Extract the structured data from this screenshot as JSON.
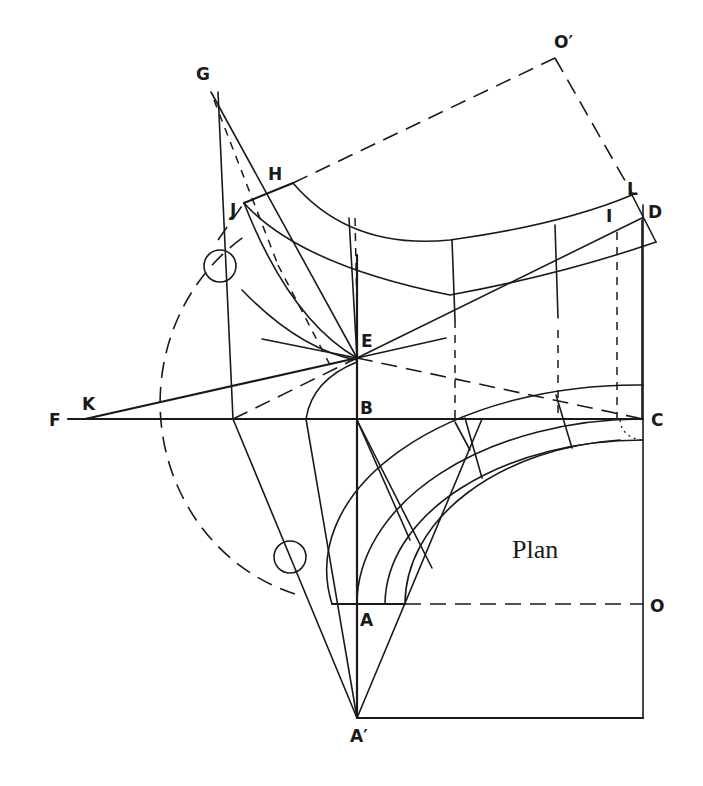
{
  "diagram": {
    "title": "Plan",
    "labels": {
      "G": "G",
      "H": "H",
      "J": "J",
      "O_prime": "O′",
      "L": "L",
      "D": "D",
      "I": "I",
      "E": "E",
      "K": "K",
      "F": "F",
      "B": "B",
      "C": "C",
      "A": "A",
      "O": "O",
      "A_prime": "A′"
    },
    "colors": {
      "ink": "#1a1a1a",
      "background": "#ffffff"
    }
  }
}
